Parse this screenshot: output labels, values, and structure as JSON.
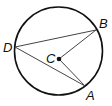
{
  "diagram": {
    "type": "circle-geometry",
    "circle": {
      "center_label": "C",
      "cx": 58.5,
      "cy": 51,
      "r": 44
    },
    "points": [
      {
        "label": "B",
        "x": 96,
        "y": 30,
        "label_x": 99,
        "label_y": 28
      },
      {
        "label": "D",
        "x": 15,
        "y": 47,
        "label_x": 3,
        "label_y": 52
      },
      {
        "label": "A",
        "x": 85,
        "y": 86,
        "label_x": 86,
        "label_y": 100
      },
      {
        "label": "C",
        "x": 59,
        "y": 59,
        "label_x": 46,
        "label_y": 63
      }
    ],
    "segments": [
      {
        "from": "D",
        "to": "B"
      },
      {
        "from": "D",
        "to": "A"
      },
      {
        "from": "C",
        "to": "B"
      },
      {
        "from": "C",
        "to": "A"
      }
    ],
    "colors": {
      "circle": "#111111",
      "segments": "#444444"
    }
  }
}
